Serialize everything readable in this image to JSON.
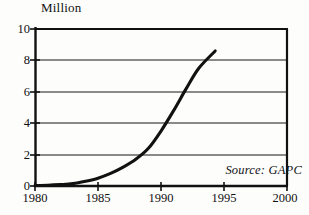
{
  "chart_data": {
    "type": "line",
    "title": "",
    "ylabel": "Million",
    "xlabel": "",
    "xlim": [
      1980,
      2000
    ],
    "ylim": [
      0,
      10
    ],
    "grid": true,
    "legend": null,
    "xticks": [
      "1980",
      "1985",
      "1990",
      "1995",
      "2000"
    ],
    "xtick_values": [
      1980,
      1985,
      1990,
      1995,
      2000
    ],
    "yticks": [
      "0",
      "2",
      "4",
      "6",
      "8",
      "10"
    ],
    "ytick_values": [
      0,
      2,
      4,
      6,
      8,
      10
    ],
    "annotations": [
      {
        "name": "source-note",
        "text": "Source: GAPC",
        "x": 1997.5,
        "y": 1.0
      }
    ],
    "series": [
      {
        "name": "Million",
        "color": "#111111",
        "x": [
          1980,
          1981,
          1982,
          1983,
          1984,
          1985,
          1986,
          1987,
          1988,
          1989,
          1990,
          1991,
          1992,
          1993,
          1994.3
        ],
        "values": [
          0.03,
          0.05,
          0.09,
          0.15,
          0.3,
          0.5,
          0.8,
          1.2,
          1.7,
          2.4,
          3.5,
          4.8,
          6.2,
          7.5,
          8.6
        ]
      }
    ]
  },
  "chart_labels": {
    "axis_title": "Million",
    "source": "Source: GAPC",
    "y": {
      "t0": "0",
      "t1": "2",
      "t2": "4",
      "t3": "6",
      "t4": "8",
      "t5": "10"
    },
    "x": {
      "t0": "1980",
      "t1": "1985",
      "t2": "1990",
      "t3": "1995",
      "t4": "2000"
    }
  },
  "colors": {
    "curve": "#111111",
    "gridline": "#8a8a8a",
    "axis": "#111111",
    "background": "#fdfdfc"
  }
}
